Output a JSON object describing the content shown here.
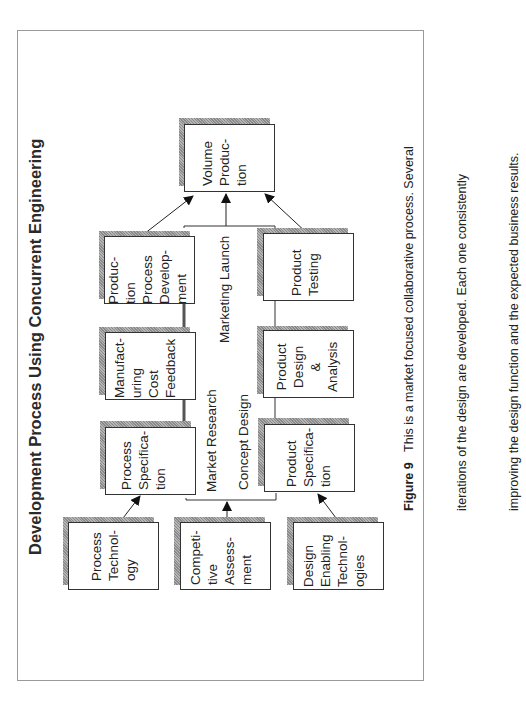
{
  "title": "Development Process Using Concurrent Engineering",
  "boxes": {
    "process_technology": "Process\nTechnol-\nogy",
    "competitive_assessment": "Competi-\ntive\nAssess-\nment",
    "design_enabling_technologies": "Design\nEnabling\nTechnol-\nogies",
    "process_specification": "Process\nSpecifica-\ntion",
    "product_specification": "Product\nSpecifica-\ntion",
    "manufacturing_cost_feedback": "Manufact-\nuring\nCost\nFeedback",
    "product_design_analysis": "Product\nDesign\n&\nAnalysis",
    "production_process_development": "Produc-\ntion\nProcess\nDevelop-\nment",
    "product_testing": "Product\nTesting",
    "volume_production": "Volume\nProduc-\ntion"
  },
  "flow_labels": {
    "market_research": "Market Research",
    "concept_design": "Concept Design",
    "marketing_launch": "Marketing Launch"
  },
  "caption": {
    "figure_label": "Figure 9",
    "line1": "This is a market focused collaborative process. Several",
    "line2": "iterations of the design are developed. Each one consistently",
    "line3": "improving the design function and the expected business results."
  },
  "colors": {
    "border": "#9a9a9a",
    "shadow": "#9a9a9a",
    "line": "#333333"
  }
}
